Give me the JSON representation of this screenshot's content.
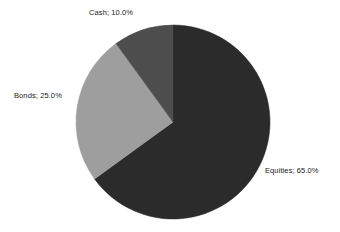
{
  "chart_data": {
    "type": "pie",
    "title": "",
    "subtitle": "",
    "xlabel": "",
    "ylabel": "",
    "categories": [
      "Equities",
      "Bonds",
      "Cash"
    ],
    "values": [
      65.0,
      25.0,
      10.0
    ],
    "value_unit": "%",
    "slices": [
      {
        "name": "Equities",
        "value": 65.0,
        "label": "Equities; 65.0%",
        "color": "#2b2b2b",
        "start_angle_deg": 0,
        "sweep_deg": 234
      },
      {
        "name": "Bonds",
        "value": 25.0,
        "label": "Bonds; 25.0%",
        "color": "#9e9e9e",
        "start_angle_deg": 234,
        "sweep_deg": 90
      },
      {
        "name": "Cash",
        "value": 10.0,
        "label": "Cash; 10.0%",
        "color": "#4d4d4d",
        "start_angle_deg": 324,
        "sweep_deg": 36
      }
    ],
    "legend": {
      "visible": false,
      "position": "none"
    },
    "data_labels": {
      "visible": true,
      "format": "name; percent",
      "separator": "; "
    },
    "grid": false,
    "start_angle_deg": 0,
    "direction": "clockwise",
    "geometry": {
      "center_x": 173,
      "center_y": 122,
      "radius": 97
    },
    "background_color": "#ffffff",
    "label_color": "#1a1a1a"
  },
  "labels": {
    "equities": "Equities; 65.0%",
    "bonds": "Bonds; 25.0%",
    "cash": "Cash; 10.0%"
  }
}
